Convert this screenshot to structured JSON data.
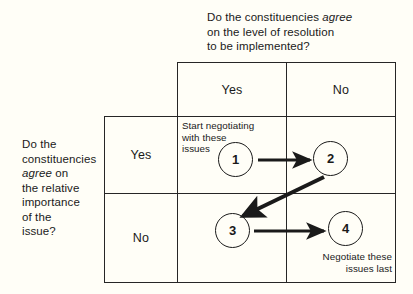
{
  "diagram": {
    "title_column_question": {
      "line1_prefix": "Do the constituencies ",
      "line1_emphasis": "agree",
      "rest": "\non the level of resolution\nto be implemented?"
    },
    "title_row_question": {
      "line1": "Do the\nconstituencies\n",
      "emphasis": "agree",
      "rest": " on\nthe relative\nimportance\nof the\nissue?"
    },
    "column_headers": [
      {
        "label": "Yes"
      },
      {
        "label": "No"
      }
    ],
    "row_headers": [
      {
        "label": "Yes"
      },
      {
        "label": "No"
      }
    ],
    "quadrants": [
      {
        "number": "1",
        "note": "Start negotiating\nwith these\nissues",
        "note_align": "left"
      },
      {
        "number": "2",
        "note": "",
        "note_align": "left"
      },
      {
        "number": "3",
        "note": "",
        "note_align": "left"
      },
      {
        "number": "4",
        "note": "Negotiate these\nissues last",
        "note_align": "right"
      }
    ],
    "arrows": [
      {
        "name": "arrow-1-to-2",
        "from": "1",
        "to": "2"
      },
      {
        "name": "arrow-2-to-3",
        "from": "2",
        "to": "3"
      },
      {
        "name": "arrow-3-to-4",
        "from": "3",
        "to": "4"
      }
    ],
    "colors": {
      "background": "#fffef7",
      "ink": "#1a1a1a",
      "border": "#262626"
    }
  }
}
